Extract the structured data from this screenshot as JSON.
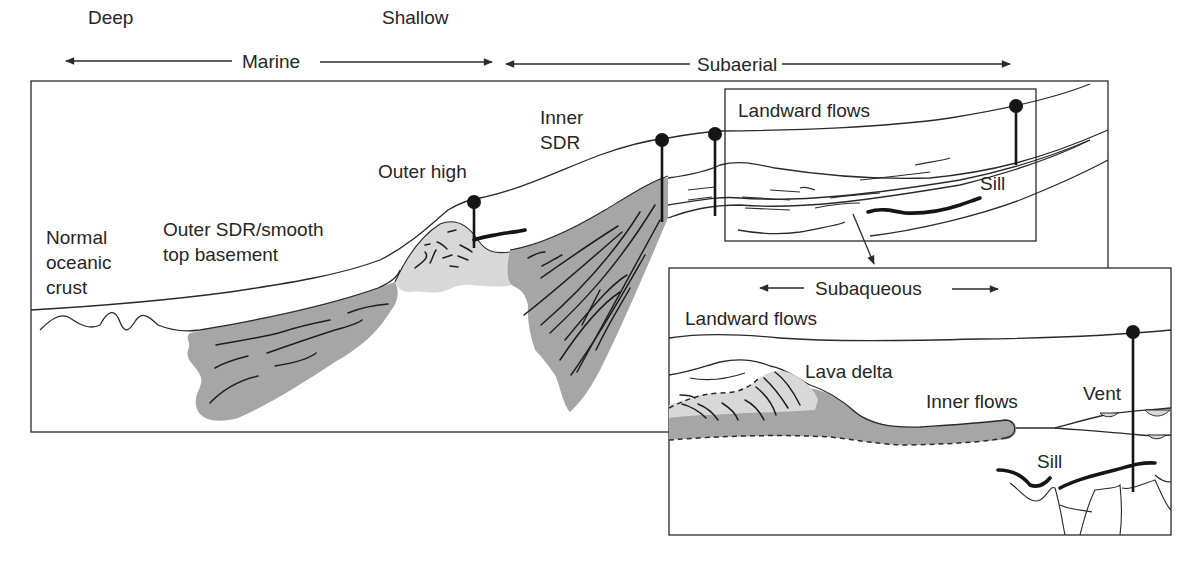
{
  "colors": {
    "line": "#2a2a2a",
    "dark_fill": "#a6a6a6",
    "light_fill": "#d8d8d8",
    "text": "#262626",
    "background": "#ffffff"
  },
  "environment_axis": {
    "deep": "Deep",
    "marine": "Marine",
    "shallow": "Shallow",
    "subaerial": "Subaerial"
  },
  "main_section": {
    "labels": {
      "normal_oceanic_crust": [
        "Normal",
        "oceanic",
        "crust"
      ],
      "outer_sdr": [
        "Outer SDR/smooth",
        "top basement"
      ],
      "outer_high": "Outer high",
      "inner_sdr": [
        "Inner",
        "SDR"
      ],
      "landward_flows": "Landward flows",
      "sill": "Sill"
    }
  },
  "inset": {
    "subaqueous": "Subaqueous",
    "labels": {
      "landward_flows": "Landward flows",
      "lava_delta": "Lava delta",
      "inner_flows": "Inner flows",
      "vent": "Vent",
      "sill": "Sill"
    }
  },
  "icons": {
    "arrow_left": "arrow-left-icon",
    "arrow_right": "arrow-right-icon",
    "well_marker": "well-marker-icon",
    "callout_arrow": "callout-arrow-icon"
  }
}
